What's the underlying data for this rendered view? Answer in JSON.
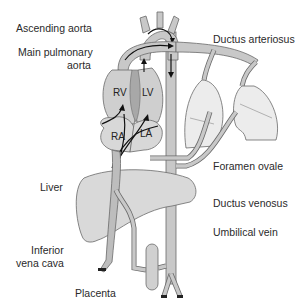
{
  "diagram": {
    "labels_left": {
      "ascending_aorta": "Ascending aorta",
      "main_pulmonary_line1": "Main pulmonary",
      "main_pulmonary_line2": "aorta",
      "liver": "Liver",
      "ivc_line1": "Inferior",
      "ivc_line2": "vena cava",
      "placenta": "Placenta"
    },
    "labels_right": {
      "ductus_arteriosus": "Ductus arteriosus",
      "foramen_ovale": "Foramen ovale",
      "ductus_venosus": "Ductus venosus",
      "umbilical_vein": "Umbilical vein"
    },
    "chambers": {
      "rv": "RV",
      "lv": "LV",
      "ra": "RA",
      "la": "LA"
    },
    "colors": {
      "vessel_fill": "#c8c8c8",
      "vessel_stroke": "#6a6a6a",
      "heart_fill": "#cfcfcf",
      "liver_fill": "#d9d9d9",
      "lung_fill": "#ececec",
      "arrow": "#111111"
    }
  }
}
